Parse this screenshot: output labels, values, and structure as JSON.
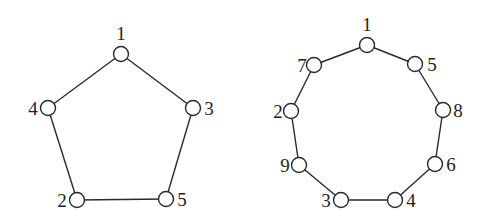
{
  "colors": {
    "line": "#2a2a2a",
    "text": "#1e1e1e",
    "node_fill": "#ffffff",
    "background": "#ffffff"
  },
  "graphs": [
    {
      "name": "pentagon",
      "nodes": [
        {
          "id": "1",
          "label": "1",
          "x": 121,
          "y": 54,
          "lx": 121,
          "ly": 40,
          "anchor": "middle"
        },
        {
          "id": "4",
          "label": "4",
          "x": 48,
          "y": 108,
          "lx": 33,
          "ly": 115,
          "anchor": "middle"
        },
        {
          "id": "3",
          "label": "3",
          "x": 193,
          "y": 108,
          "lx": 209,
          "ly": 115,
          "anchor": "middle"
        },
        {
          "id": "2",
          "label": "2",
          "x": 77,
          "y": 200,
          "lx": 62,
          "ly": 207,
          "anchor": "middle"
        },
        {
          "id": "5",
          "label": "5",
          "x": 166,
          "y": 199,
          "lx": 182,
          "ly": 206,
          "anchor": "middle"
        }
      ],
      "edges": [
        [
          "1",
          "4"
        ],
        [
          "1",
          "3"
        ],
        [
          "4",
          "2"
        ],
        [
          "3",
          "5"
        ],
        [
          "2",
          "5"
        ]
      ]
    },
    {
      "name": "nonagon",
      "nodes": [
        {
          "id": "1",
          "label": "1",
          "x": 367,
          "y": 45,
          "lx": 367,
          "ly": 31,
          "anchor": "middle"
        },
        {
          "id": "7",
          "label": "7",
          "x": 314,
          "y": 65,
          "lx": 302,
          "ly": 72,
          "anchor": "middle"
        },
        {
          "id": "5",
          "label": "5",
          "x": 415,
          "y": 64,
          "lx": 432,
          "ly": 71,
          "anchor": "middle"
        },
        {
          "id": "2",
          "label": "2",
          "x": 291,
          "y": 111,
          "lx": 278,
          "ly": 118,
          "anchor": "middle"
        },
        {
          "id": "8",
          "label": "8",
          "x": 443,
          "y": 110,
          "lx": 458,
          "ly": 117,
          "anchor": "middle"
        },
        {
          "id": "9",
          "label": "9",
          "x": 299,
          "y": 165,
          "lx": 285,
          "ly": 172,
          "anchor": "middle"
        },
        {
          "id": "6",
          "label": "6",
          "x": 435,
          "y": 164,
          "lx": 451,
          "ly": 171,
          "anchor": "middle"
        },
        {
          "id": "3",
          "label": "3",
          "x": 341,
          "y": 200,
          "lx": 326,
          "ly": 207,
          "anchor": "middle"
        },
        {
          "id": "4",
          "label": "4",
          "x": 395,
          "y": 200,
          "lx": 411,
          "ly": 207,
          "anchor": "middle"
        }
      ],
      "edges": [
        [
          "1",
          "7"
        ],
        [
          "1",
          "5"
        ],
        [
          "7",
          "2"
        ],
        [
          "5",
          "8"
        ],
        [
          "2",
          "9"
        ],
        [
          "8",
          "6"
        ],
        [
          "9",
          "3"
        ],
        [
          "6",
          "4"
        ],
        [
          "3",
          "4"
        ]
      ]
    }
  ],
  "node_radius": 7.5
}
